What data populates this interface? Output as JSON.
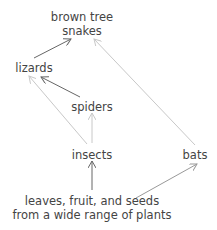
{
  "diagram": {
    "nodes": [
      {
        "id": "snakes",
        "label_lines": [
          "brown tree",
          "snakes"
        ],
        "x": 82,
        "y": 10
      },
      {
        "id": "lizards",
        "label_lines": [
          "lizards"
        ],
        "x": 34,
        "y": 61
      },
      {
        "id": "spiders",
        "label_lines": [
          "spiders"
        ],
        "x": 92,
        "y": 100
      },
      {
        "id": "insects",
        "label_lines": [
          "insects"
        ],
        "x": 92,
        "y": 148
      },
      {
        "id": "bats",
        "label_lines": [
          "bats"
        ],
        "x": 195,
        "y": 148
      },
      {
        "id": "plants",
        "label_lines": [
          "leaves, fruit, and seeds",
          "from a wide range of plants"
        ],
        "x": 92,
        "y": 194
      }
    ],
    "edges": [
      {
        "from": "lizards",
        "to": "snakes",
        "color": "#666666"
      },
      {
        "from": "spiders",
        "to": "lizards",
        "color": "#666666"
      },
      {
        "from": "insects",
        "to": "lizards",
        "color": "#c8c8c8"
      },
      {
        "from": "insects",
        "to": "spiders",
        "color": "#c8c8c8"
      },
      {
        "from": "bats",
        "to": "snakes",
        "color": "#c8c8c8"
      },
      {
        "from": "plants",
        "to": "insects",
        "color": "#666666"
      },
      {
        "from": "plants",
        "to": "bats",
        "color": "#999999"
      }
    ]
  }
}
